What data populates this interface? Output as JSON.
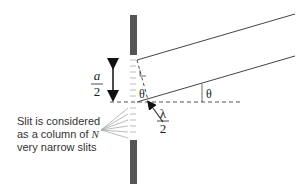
{
  "diagram": {
    "type": "single-slit-diffraction",
    "labels": {
      "half_width_numerator": "a",
      "half_width_denominator": "2",
      "angle_inner": "θ",
      "angle_outer": "θ",
      "path_diff_numerator": "λ",
      "path_diff_denominator": "2"
    },
    "caption": {
      "line1": "Slit is considered",
      "line2_prefix": "as a column of ",
      "line2_var": "N",
      "line3": "very narrow slits"
    },
    "colors": {
      "barrier": "#555555",
      "lines": "#444444",
      "text": "#333333"
    }
  }
}
